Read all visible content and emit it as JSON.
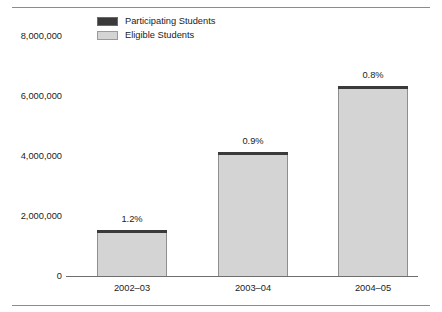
{
  "chart_data": {
    "type": "bar",
    "subtype": "stacked-bar",
    "title": "",
    "subtitle": "",
    "xlabel": "",
    "ylabel": "",
    "categories": [
      "2002–03",
      "2003–04",
      "2004–05"
    ],
    "series": [
      {
        "name": "Participating Students",
        "color": "#3a3a3a",
        "values": [
          18000,
          37000,
          51000
        ]
      },
      {
        "name": "Eligible Students",
        "color": "#d4d4d4",
        "values": [
          1520000,
          4090000,
          6280000
        ]
      }
    ],
    "totals": [
      1540000,
      4130000,
      6330000
    ],
    "data_labels": [
      "1.2%",
      "0.9%",
      "0.8%"
    ],
    "ylim": [
      0,
      8000000
    ],
    "yticks": [
      0,
      2000000,
      4000000,
      6000000,
      8000000
    ],
    "ytick_labels": [
      "0",
      "2,000,000",
      "4,000,000",
      "6,000,000",
      "8,000,000"
    ],
    "grid": false,
    "legend_position": "top-left"
  },
  "legend": {
    "items": [
      {
        "label": "Participating Students",
        "color": "#3a3a3a",
        "border": "#6a6a6a"
      },
      {
        "label": "Eligible Students",
        "color": "#d4d4d4",
        "border": "#9a9a9a"
      }
    ]
  },
  "axes": {
    "y_tick_labels": [
      "8,000,000",
      "6,000,000",
      "4,000,000",
      "2,000,000",
      "0"
    ],
    "x_tick_labels": [
      "2002–03",
      "2003–04",
      "2004–05"
    ]
  },
  "bars": [
    {
      "category": "2002–03",
      "pct_label": "1.2%"
    },
    {
      "category": "2003–04",
      "pct_label": "0.9%"
    },
    {
      "category": "2004–05",
      "pct_label": "0.8%"
    }
  ],
  "colors": {
    "participating": "#3a3a3a",
    "eligible": "#d4d4d4",
    "bar_outline": "#8f8f8f",
    "axis": "#6e6e6e",
    "rule": "#8c8c8c",
    "text": "#1c1c1c",
    "background": "#ffffff"
  }
}
